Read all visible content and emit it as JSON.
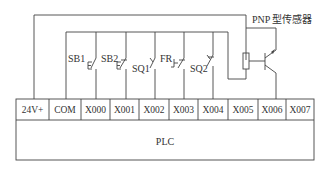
{
  "diagram": {
    "plc_label": "PLC",
    "terminals": [
      {
        "label": "24V+",
        "x1": 16,
        "x2": 49
      },
      {
        "label": "COM",
        "x1": 49,
        "x2": 81
      },
      {
        "label": "X000",
        "x1": 81,
        "x2": 110
      },
      {
        "label": "X001",
        "x1": 110,
        "x2": 139
      },
      {
        "label": "X002",
        "x1": 139,
        "x2": 169
      },
      {
        "label": "X003",
        "x1": 169,
        "x2": 198
      },
      {
        "label": "X004",
        "x1": 198,
        "x2": 228
      },
      {
        "label": "X005",
        "x1": 228,
        "x2": 258
      },
      {
        "label": "X006",
        "x1": 258,
        "x2": 286
      },
      {
        "label": "X007",
        "x1": 286,
        "x2": 314
      }
    ],
    "switches": [
      {
        "label": "SB1",
        "type": "pushbutton-no"
      },
      {
        "label": "SB2",
        "type": "pushbutton-nc"
      },
      {
        "label": "SQ1",
        "type": "limit-switch-no"
      },
      {
        "label": "FR",
        "type": "thermal-relay-nc"
      },
      {
        "label": "SQ2",
        "type": "limit-switch-nc"
      }
    ],
    "sensor_label": "PNP 型传感器"
  }
}
